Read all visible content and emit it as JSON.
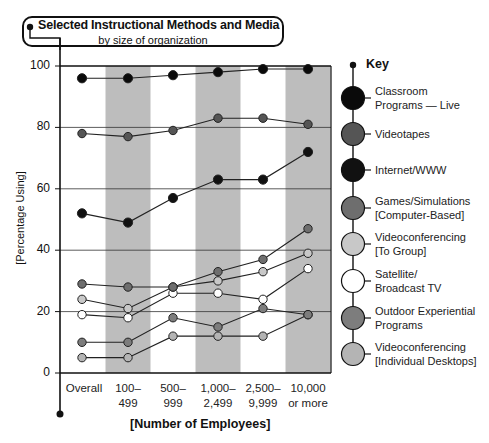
{
  "chart_data": {
    "type": "line",
    "title": "Selected Instructional Methods and Media",
    "subtitle": "by size of organization",
    "xlabel": "[Number of Employees]",
    "ylabel": "[Percentage Using]",
    "ylim": [
      0,
      100
    ],
    "yticks": [
      "0",
      "20",
      "40",
      "60",
      "80",
      "100"
    ],
    "categories": [
      "Overall",
      "100–499",
      "500–999",
      "1,000–2,499",
      "2,500–9,999",
      "10,000 or more"
    ],
    "category_lines": [
      [
        "Overall",
        ""
      ],
      [
        "100–",
        "499"
      ],
      [
        "500–",
        "999"
      ],
      [
        "1,000–",
        "2,499"
      ],
      [
        "2,500–",
        "9,999"
      ],
      [
        "10,000",
        "or more"
      ]
    ],
    "grid": "horizontal at 20-unit intervals; alternating shaded vertical bands",
    "legend_position": "right",
    "legend_title": "Key",
    "series": [
      {
        "name": "Classroom Programs — Live",
        "label_lines": [
          "Classroom",
          "Programs — Live"
        ],
        "color": "#0a0a0a",
        "values": [
          96,
          96,
          97,
          98,
          99,
          99
        ]
      },
      {
        "name": "Videotapes",
        "label_lines": [
          "Videotapes"
        ],
        "color": "#555555",
        "values": [
          78,
          77,
          79,
          83,
          83,
          81
        ]
      },
      {
        "name": "Internet/WWW",
        "label_lines": [
          "Internet/WWW"
        ],
        "color": "#111111",
        "values": [
          52,
          49,
          57,
          63,
          63,
          72
        ]
      },
      {
        "name": "Games/Simulations [Computer-Based]",
        "label_lines": [
          "Games/Simulations",
          "[Computer-Based]"
        ],
        "color": "#6e6e6e",
        "values": [
          29,
          28,
          28,
          33,
          37,
          47
        ]
      },
      {
        "name": "Videoconferencing [To Group]",
        "label_lines": [
          "Videoconferencing",
          "[To Group]"
        ],
        "color": "#c8c8c8",
        "values": [
          24,
          21,
          28,
          30,
          33,
          39
        ]
      },
      {
        "name": "Satellite/ Broadcast TV",
        "label_lines": [
          "Satellite/",
          "Broadcast TV"
        ],
        "color": "#ffffff",
        "values": [
          19,
          18,
          26,
          26,
          24,
          34
        ]
      },
      {
        "name": "Outdoor Experiential Programs",
        "label_lines": [
          "Outdoor Experiential",
          "Programs"
        ],
        "color": "#7d7d7d",
        "values": [
          10,
          10,
          18,
          15,
          21,
          19
        ]
      },
      {
        "name": "Videoconferencing [Individual Desktops]",
        "label_lines": [
          "Videoconferencing",
          "[Individual Desktops]"
        ],
        "color": "#b4b4b4",
        "values": [
          5,
          5,
          12,
          12,
          12,
          19
        ]
      }
    ]
  },
  "colors": {
    "band": "#bdbdbd",
    "axis": "#111111",
    "grid": "#333333"
  }
}
